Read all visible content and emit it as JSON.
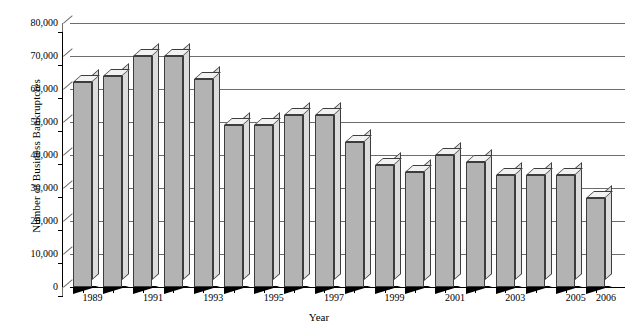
{
  "chart_data": {
    "type": "bar",
    "title": "",
    "xlabel": "Year",
    "ylabel": "Number of Business Bankruptcies",
    "categories": [
      "1989",
      "1990",
      "1991",
      "1992",
      "1993",
      "1994",
      "1995",
      "1996",
      "1997",
      "1998",
      "1999",
      "2000",
      "2001",
      "2002",
      "2003",
      "2004",
      "2005",
      "2006"
    ],
    "values": [
      62000,
      64000,
      70000,
      70000,
      63000,
      49000,
      49000,
      52000,
      52000,
      44000,
      37000,
      35000,
      40000,
      38000,
      34000,
      34000,
      34000,
      27000
    ],
    "x_tick_labels": [
      "1989",
      "",
      "1991",
      "",
      "1993",
      "",
      "1995",
      "",
      "1997",
      "",
      "1999",
      "",
      "2001",
      "",
      "2003",
      "",
      "2005",
      "2006"
    ],
    "y_tick_labels": [
      "80,000",
      "70,000",
      "60,000",
      "50,000",
      "40,000",
      "30,000",
      "20,000",
      "10,000",
      "0"
    ],
    "y_ticks": [
      80000,
      70000,
      60000,
      50000,
      40000,
      30000,
      20000,
      10000,
      0
    ],
    "ylim": [
      0,
      80000
    ],
    "grid": true,
    "legend": "none",
    "style_3d": true,
    "bar_face_color": "#b3b3b3",
    "bar_side_color": "#dcdcdc",
    "bar_top_color": "#f2f2f2",
    "bar_edge_color": "#3d3d3d",
    "gridline_color": "#6d6d6d",
    "axis_color": "#000000",
    "background_color": "#ffffff"
  }
}
